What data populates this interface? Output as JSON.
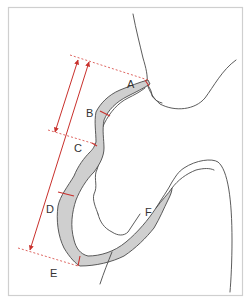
{
  "figure": {
    "type": "anatomical-diagram",
    "labels": {
      "A": "A",
      "B": "B",
      "C": "C",
      "D": "D",
      "E": "E",
      "F": "F"
    },
    "colors": {
      "frame": "#cfcfcf",
      "outline": "#4a4a4a",
      "tissue_fill": "#cfcfcf",
      "measurement": "#c9302c"
    },
    "measurements": [
      {
        "name": "A-to-C",
        "style": "double-arrow"
      },
      {
        "name": "A-to-E",
        "style": "double-arrow"
      }
    ]
  }
}
